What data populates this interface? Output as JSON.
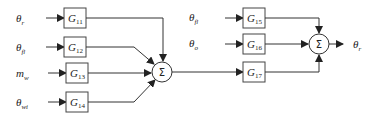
{
  "diagram": {
    "type": "block-diagram",
    "inputs_stage1": [
      {
        "symbol": "θ",
        "sub": "r"
      },
      {
        "symbol": "θ",
        "sub": "fl"
      },
      {
        "symbol": "m",
        "sub": "w"
      },
      {
        "symbol": "θ",
        "sub": "wi"
      }
    ],
    "blocks_stage1": [
      {
        "name": "G",
        "sub": "11"
      },
      {
        "name": "G",
        "sub": "12"
      },
      {
        "name": "G",
        "sub": "13"
      },
      {
        "name": "G",
        "sub": "14"
      }
    ],
    "sum1": {
      "symbol": "Σ"
    },
    "inputs_stage2": [
      {
        "symbol": "θ",
        "sub": "fl"
      },
      {
        "symbol": "θ",
        "sub": "o"
      }
    ],
    "blocks_stage2": [
      {
        "name": "G",
        "sub": "15"
      },
      {
        "name": "G",
        "sub": "16"
      },
      {
        "name": "G",
        "sub": "17"
      }
    ],
    "sum2": {
      "symbol": "Σ"
    },
    "output": {
      "symbol": "θ",
      "sub": "r"
    }
  }
}
